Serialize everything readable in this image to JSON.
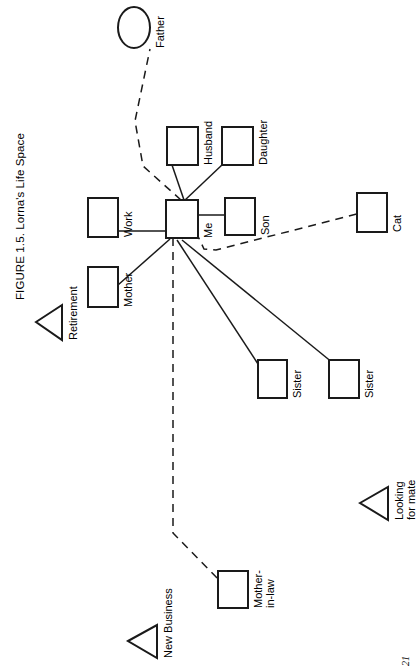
{
  "figure": {
    "title": "FIGURE 1.5. Lorna's Life Space",
    "page_number": "21",
    "orientation": "rotated-90-ccw",
    "diagram_type": "ecomap"
  },
  "nodes": [
    {
      "id": "father",
      "label": "Father",
      "shape": "circle",
      "x": 118,
      "y": 7,
      "w": 32,
      "h": 41
    },
    {
      "id": "husband",
      "label": "Husband",
      "shape": "square",
      "x": 167,
      "y": 127,
      "w": 31,
      "h": 38
    },
    {
      "id": "daughter",
      "label": "Daughter",
      "shape": "square",
      "x": 222,
      "y": 127,
      "w": 31,
      "h": 38
    },
    {
      "id": "work",
      "label": "Work",
      "shape": "square",
      "x": 88,
      "y": 198,
      "w": 30,
      "h": 39
    },
    {
      "id": "me",
      "label": "Me",
      "shape": "square",
      "x": 166,
      "y": 200,
      "w": 32,
      "h": 38
    },
    {
      "id": "son",
      "label": "Son",
      "shape": "square",
      "x": 225,
      "y": 198,
      "w": 30,
      "h": 37
    },
    {
      "id": "cat",
      "label": "Cat",
      "shape": "square",
      "x": 357,
      "y": 193,
      "w": 30,
      "h": 39
    },
    {
      "id": "mother",
      "label": "Mother",
      "shape": "square",
      "x": 88,
      "y": 267,
      "w": 30,
      "h": 40
    },
    {
      "id": "sister1",
      "label": "Sister",
      "shape": "square",
      "x": 258,
      "y": 360,
      "w": 29,
      "h": 38
    },
    {
      "id": "sister2",
      "label": "Sister",
      "shape": "square",
      "x": 329,
      "y": 360,
      "w": 30,
      "h": 38
    },
    {
      "id": "mother-in-law",
      "label": "Mother-\nin-law",
      "shape": "square",
      "x": 218,
      "y": 571,
      "w": 30,
      "h": 37
    }
  ],
  "goals": [
    {
      "id": "retirement",
      "label": "Retirement",
      "shape": "triangle",
      "apex_x": 36,
      "apex_y": 322,
      "base_x": 62,
      "base_top_y": 305,
      "base_bottom_y": 340
    },
    {
      "id": "looking-for-mate",
      "label": "Looking\nfor mate",
      "shape": "triangle",
      "apex_x": 360,
      "apex_y": 503,
      "base_x": 388,
      "base_top_y": 487,
      "base_bottom_y": 520
    },
    {
      "id": "new-business",
      "label": "New Business",
      "shape": "triangle",
      "apex_x": 128,
      "apex_y": 641,
      "base_x": 157,
      "base_top_y": 625,
      "base_bottom_y": 658
    }
  ],
  "links": [
    {
      "id": "me-father",
      "from": "me",
      "to": "father",
      "style": "dashed",
      "points": "181,200 143,166 135,121 150,49"
    },
    {
      "id": "me-husband",
      "from": "me",
      "to": "husband",
      "style": "solid",
      "points": "184,200 172,165"
    },
    {
      "id": "me-daughter",
      "from": "me",
      "to": "daughter",
      "style": "solid",
      "points": "184,201 223,164"
    },
    {
      "id": "me-work",
      "from": "me",
      "to": "work",
      "style": "solid",
      "points": "166,231 118,231"
    },
    {
      "id": "me-son",
      "from": "me",
      "to": "son",
      "style": "solid",
      "points": "198,215 225,215"
    },
    {
      "id": "me-mother",
      "from": "me",
      "to": "mother",
      "style": "solid",
      "points": "170,239 118,285"
    },
    {
      "id": "me-cat",
      "from": "me",
      "to": "cat",
      "style": "dashed",
      "points": "196,232 204,249 216,250 357,214"
    },
    {
      "id": "me-sister1",
      "from": "me",
      "to": "sister1",
      "style": "solid",
      "points": "177,240 260,367"
    },
    {
      "id": "me-sister2",
      "from": "me",
      "to": "sister2",
      "style": "solid",
      "points": "182,240 333,363"
    },
    {
      "id": "me-mother-in-law",
      "from": "me",
      "to": "mother-in-law",
      "style": "dashed",
      "points": "173,238 173,533 219,580"
    }
  ],
  "legend_notes": {
    "square_meaning": "person / system",
    "circle_meaning": "person",
    "triangle_meaning": "goal",
    "solid_meaning": "strong connection",
    "dashed_meaning": "tenuous connection"
  },
  "colors": {
    "background": "#ffffff",
    "ink": "#000000",
    "line": "#1a1a1a"
  }
}
